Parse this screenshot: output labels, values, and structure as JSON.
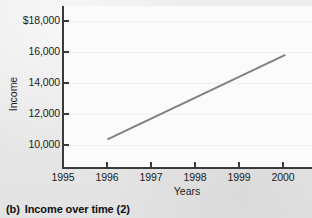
{
  "caption": {
    "tag": "(b)",
    "text": "Income over time (2)"
  },
  "chart_data": {
    "type": "line",
    "title": "",
    "subtitle": "",
    "xlabel": "Years",
    "ylabel": "Income",
    "x": [
      1996,
      1997,
      1998,
      1999,
      2000
    ],
    "values": [
      10700,
      11950,
      13200,
      14450,
      15700
    ],
    "series": [
      {
        "name": "Income",
        "x": [
          1996,
          2000
        ],
        "values": [
          10700,
          15700
        ],
        "color": "#808080",
        "line_width": 2,
        "markers": false
      }
    ],
    "xlim": [
      1995,
      2000.6
    ],
    "ylim": [
      9000,
      18600
    ],
    "xticks": [
      1995,
      1996,
      1997,
      1998,
      1999,
      2000
    ],
    "xticklabels": [
      "1995",
      "1996",
      "1997",
      "1998",
      "1999",
      "2000"
    ],
    "yticks": [
      10000,
      12000,
      14000,
      16000,
      18000
    ],
    "yticklabels": [
      "10,000",
      "12,000",
      "14,000",
      "16,000",
      "$18,000"
    ],
    "grid": true,
    "grid_axis": "y",
    "grid_color": "#f0f0f0",
    "legend": false,
    "legend_position": "none",
    "y_axis_truncated": true,
    "annotations": []
  },
  "colors": {
    "background": "#e9e9e9",
    "plot_area": "#fbfbfb",
    "axis": "#3a3a3a",
    "text": "#1b1b1b",
    "series": "#808080"
  }
}
